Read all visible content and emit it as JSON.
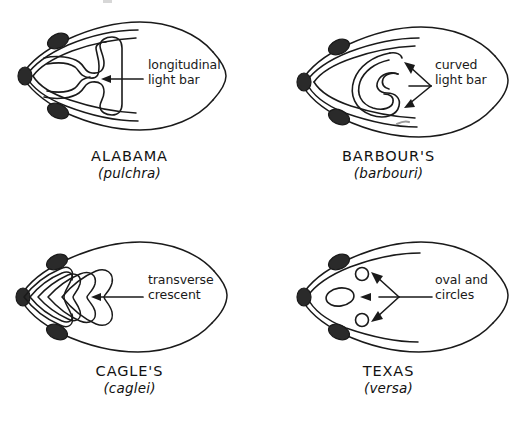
{
  "plate": {
    "title_visible": false,
    "background_color": "#ffffff",
    "ink_color": "#1a1a1a",
    "view": "dorsal head pattern comparison",
    "panel_count": 4
  },
  "panels": [
    {
      "id": "alabama",
      "position": "top-left",
      "common_name": "ALABAMA",
      "latin_name": "(pulchra)",
      "annotation_line1": "longitudinal",
      "annotation_line2": "light bar",
      "annotation_text": "longitudinal light bar",
      "arrow_type": "single",
      "marking_shape": "longitudinal-light-bar",
      "annotation_x": 148,
      "annotation_y": 58
    },
    {
      "id": "barbours",
      "position": "top-right",
      "common_name": "BARBOUR'S",
      "latin_name": "(barbouri)",
      "annotation_line1": "curved",
      "annotation_line2": "light bar",
      "annotation_text": "curved light bar",
      "arrow_type": "double",
      "marking_shape": "curved-light-bar",
      "annotation_x": 176,
      "annotation_y": 58
    },
    {
      "id": "cagles",
      "position": "bottom-left",
      "common_name": "CAGLE'S",
      "latin_name": "(caglei)",
      "annotation_line1": "transverse",
      "annotation_line2": "crescent",
      "annotation_text": "transverse crescent",
      "arrow_type": "single",
      "marking_shape": "transverse-crescent",
      "annotation_x": 148,
      "annotation_y": 56
    },
    {
      "id": "texas",
      "position": "bottom-right",
      "common_name": "TEXAS",
      "latin_name": "(versa)",
      "annotation_line1": "oval and",
      "annotation_line2": "circles",
      "annotation_text": "oval and circles",
      "arrow_type": "triple",
      "marking_shape": "oval-and-circles",
      "annotation_x": 176,
      "annotation_y": 56
    }
  ]
}
